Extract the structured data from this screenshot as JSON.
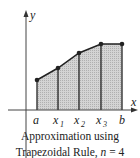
{
  "diagram": {
    "axis_labels": {
      "x": "x",
      "y": "y"
    },
    "tick_labels": [
      {
        "main": "a",
        "sub": ""
      },
      {
        "main": "x",
        "sub": "1"
      },
      {
        "main": "x",
        "sub": "2"
      },
      {
        "main": "x",
        "sub": "3"
      },
      {
        "main": "b",
        "sub": ""
      }
    ],
    "points": [
      {
        "x": 37,
        "y": 80
      },
      {
        "x": 58,
        "y": 68
      },
      {
        "x": 79,
        "y": 53
      },
      {
        "x": 101,
        "y": 44
      },
      {
        "x": 122,
        "y": 44
      }
    ],
    "fill_color": "#c8c8c8",
    "line_color": "#222222"
  },
  "caption": {
    "line1": "Approximation using",
    "line2_prefix": "Trapezoidal Rule, ",
    "line2_var": "n",
    "line2_suffix": " = 4"
  }
}
